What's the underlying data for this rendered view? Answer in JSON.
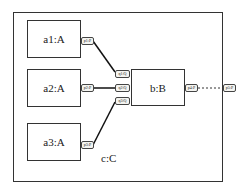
{
  "diagram": {
    "container": {
      "label": "c:C"
    },
    "parts": [
      {
        "id": "a1",
        "label": "a1:A"
      },
      {
        "id": "a2",
        "label": "a2:A"
      },
      {
        "id": "a3",
        "label": "a3:A"
      },
      {
        "id": "b",
        "label": "b:B"
      }
    ],
    "ports": [
      {
        "id": "p1",
        "label": "p1:P",
        "owner": "a1"
      },
      {
        "id": "p2",
        "label": "p2:P",
        "owner": "a2"
      },
      {
        "id": "p3",
        "label": "p3:P",
        "owner": "a3"
      },
      {
        "id": "q1",
        "label": "q1:Q",
        "owner": "b"
      },
      {
        "id": "q2",
        "label": "q2:Q",
        "owner": "b"
      },
      {
        "id": "q3",
        "label": "q3:Q",
        "owner": "b"
      },
      {
        "id": "p4",
        "label": "p4:P",
        "owner": "b"
      },
      {
        "id": "p5",
        "label": "p5:P",
        "owner": "c"
      }
    ],
    "connectors": [
      {
        "from": "p1",
        "to": "q1",
        "style": "solid"
      },
      {
        "from": "p2",
        "to": "q2",
        "style": "solid"
      },
      {
        "from": "p3",
        "to": "q3",
        "style": "solid"
      },
      {
        "from": "p4",
        "to": "p5",
        "style": "dashed"
      }
    ]
  }
}
